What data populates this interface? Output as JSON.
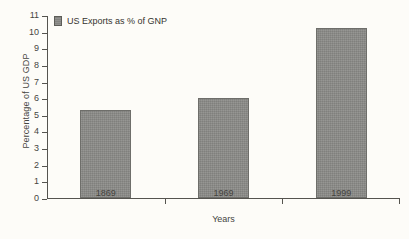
{
  "chart_data": {
    "type": "bar",
    "title": "",
    "subtitle": "",
    "categories": [
      "1869",
      "1969",
      "1999"
    ],
    "values": [
      5.3,
      6.0,
      10.2
    ],
    "series": [
      {
        "name": "US Exports as % of GNP",
        "values": [
          5.3,
          6.0,
          10.2
        ]
      }
    ],
    "xlabel": "Years",
    "ylabel": "Percentage of US GDP",
    "ylim": [
      0,
      11
    ],
    "ytick_step": 1,
    "yticks": [
      "0",
      "1",
      "2",
      "3",
      "4",
      "5",
      "6",
      "7",
      "8",
      "9",
      "10",
      "11"
    ],
    "grid": false,
    "legend": {
      "position": "top-left",
      "entries": [
        {
          "label": "US Exports as % of GNP",
          "color": "#8a8a87"
        }
      ]
    },
    "colors": {
      "background": "#fdfcf8",
      "bar_fill": "#8a8a87",
      "bar_edge": "#6e6e6a",
      "axis": "#55544f",
      "text": "#45443f"
    }
  }
}
